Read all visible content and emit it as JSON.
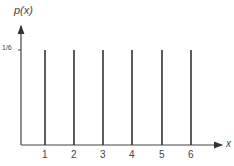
{
  "chart_data": {
    "type": "bar",
    "title": "",
    "xlabel": "x",
    "ylabel": "p(x)",
    "categories": [
      "1",
      "2",
      "3",
      "4",
      "5",
      "6"
    ],
    "values": [
      0.1667,
      0.1667,
      0.1667,
      0.1667,
      0.1667,
      0.1667
    ],
    "y_tick_labels": [
      "1/6"
    ],
    "grid": false,
    "legend": null
  },
  "labels": {
    "ylabel": "p(x)",
    "xlabel": "x",
    "ytick": "1/6",
    "xticks": [
      "1",
      "2",
      "3",
      "4",
      "5",
      "6"
    ]
  }
}
